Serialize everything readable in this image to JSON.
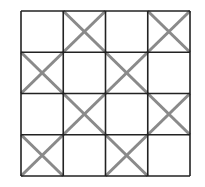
{
  "diagram": {
    "type": "grid",
    "rows": 4,
    "cols": 4,
    "origin": [
      21,
      11
    ],
    "size": [
      169,
      165
    ],
    "line_color": "#222222",
    "mark_color": "#8a8a8a",
    "marks": [
      [
        false,
        true,
        false,
        true
      ],
      [
        true,
        false,
        true,
        false
      ],
      [
        false,
        true,
        false,
        true
      ],
      [
        true,
        false,
        true,
        false
      ]
    ],
    "mark_symbol": "X"
  }
}
